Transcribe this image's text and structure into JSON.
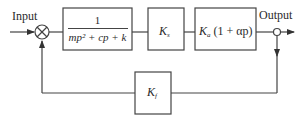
{
  "diagram": {
    "type": "block-diagram",
    "labels": {
      "input": "Input",
      "output": "Output"
    },
    "blocks": {
      "plant": {
        "numerator": "1",
        "denominator": "mp² + cp + k"
      },
      "ks": {
        "symbol": "K",
        "subscript": "s"
      },
      "ka": {
        "symbol": "K",
        "subscript": "a",
        "suffix": " (1 + αp)"
      },
      "kf": {
        "symbol": "K",
        "subscript": "f"
      }
    },
    "summing_junction": {
      "symbol": "⊗",
      "signs": [
        "+",
        "-"
      ]
    },
    "connections": [
      "Input → summing junction",
      "summing junction → 1/(mp²+cp+k)",
      "1/(mp²+cp+k) → Ks",
      "Ks → Ka(1+αp)",
      "Ka(1+αp) → Output",
      "Output → Kf (feedback)",
      "Kf → summing junction"
    ],
    "line_color": "#444444"
  }
}
